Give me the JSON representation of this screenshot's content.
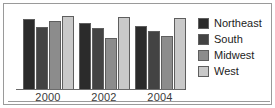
{
  "chart_data": {
    "type": "bar",
    "title": "",
    "subtitle": "",
    "xlabel": "",
    "ylabel": "",
    "categories": [
      "2000",
      "2002",
      "2004"
    ],
    "series": [
      {
        "name": "Northeast",
        "color": "#2b2b2b",
        "values": [
          72,
          68,
          65
        ]
      },
      {
        "name": "South",
        "color": "#434343",
        "values": [
          64,
          63,
          60
        ]
      },
      {
        "name": "Midwest",
        "color": "#8c8c8c",
        "values": [
          70,
          53,
          55
        ]
      },
      {
        "name": "West",
        "color": "#c9c9c9",
        "values": [
          75,
          74,
          73
        ]
      }
    ],
    "ylim": [
      0,
      80
    ],
    "grid": false,
    "legend_position": "right",
    "axis_tick_labels": [
      "2000",
      "2002",
      "2004"
    ],
    "y_axis_visible": false,
    "x_axis_visible": true
  },
  "legend": {
    "items": [
      {
        "label": "Northeast",
        "color": "#2b2b2b"
      },
      {
        "label": "South",
        "color": "#434343"
      },
      {
        "label": "Midwest",
        "color": "#8c8c8c"
      },
      {
        "label": "West",
        "color": "#c9c9c9"
      }
    ]
  },
  "style": {
    "frame_color": "#9a9a9a",
    "bar_outline": "#5e5e5e",
    "axis_color": "#6b6b6b",
    "text_color": "#1c1c1c",
    "tick_text_color": "#3b3b3b",
    "background": "#ffffff"
  }
}
